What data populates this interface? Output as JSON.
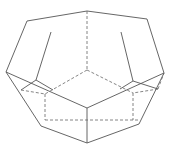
{
  "diagram": {
    "type": "polyhedron-wireframe",
    "colors": {
      "background": "#ffffff",
      "visible_edge": "#555555",
      "hidden_edge": "#666666"
    },
    "vertices": {
      "top_center": [
        87,
        11
      ],
      "top_left": [
        27,
        21
      ],
      "top_right": [
        147,
        19
      ],
      "left": [
        6,
        72
      ],
      "right": [
        164,
        73
      ],
      "inner_left_top": [
        51,
        32
      ],
      "inner_left": [
        36,
        80
      ],
      "inner_right_top": [
        121,
        32
      ],
      "inner_right": [
        133,
        81
      ],
      "left_low": [
        21,
        90
      ],
      "right_low": [
        158,
        89
      ],
      "back_center": [
        87,
        70
      ],
      "front_center": [
        87,
        108
      ],
      "bottom": [
        87,
        143
      ],
      "bottom_left": [
        41,
        126
      ],
      "bottom_right": [
        139,
        124
      ],
      "hidden_left": [
        45,
        94
      ],
      "hidden_right": [
        133,
        93
      ],
      "hidden_bottom_left": [
        45,
        120
      ],
      "hidden_bottom_right": [
        139,
        120
      ]
    },
    "visible_edges": [
      [
        "top_left",
        "top_center"
      ],
      [
        "top_center",
        "top_right"
      ],
      [
        "top_left",
        "left"
      ],
      [
        "top_right",
        "right"
      ],
      [
        "inner_left_top",
        "inner_left"
      ],
      [
        "inner_right_top",
        "inner_right"
      ],
      [
        "left",
        "front_center"
      ],
      [
        "right",
        "front_center"
      ],
      [
        "inner_left",
        "left_low"
      ],
      [
        "inner_right",
        "right_low"
      ],
      [
        "left",
        "bottom_left"
      ],
      [
        "right",
        "bottom_right"
      ],
      [
        "bottom_left",
        "bottom"
      ],
      [
        "bottom_right",
        "bottom"
      ],
      [
        "front_center",
        "bottom"
      ],
      [
        "inner_left",
        "inner_left_mid"
      ],
      [
        "inner_right",
        "inner_right_mid"
      ]
    ],
    "hidden_edges": [
      [
        "top_center",
        "back_center"
      ],
      [
        "back_center",
        "hidden_left"
      ],
      [
        "back_center",
        "hidden_right"
      ],
      [
        "hidden_left",
        "hidden_bottom_left"
      ],
      [
        "hidden_right",
        "hidden_bottom_right"
      ],
      [
        "hidden_bottom_left",
        "hidden_bottom_right"
      ],
      [
        "left_low",
        "hidden_left"
      ],
      [
        "right_low",
        "hidden_right"
      ],
      [
        "hidden_bottom_left",
        "bottom_left"
      ],
      [
        "hidden_bottom_right",
        "bottom_right"
      ]
    ]
  }
}
